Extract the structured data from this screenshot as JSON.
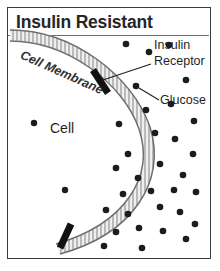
{
  "figure": {
    "title": "Insulin Resistant",
    "type": "biology-diagram",
    "frame_color": "#3a3a3a",
    "background": "#ffffff"
  },
  "labels": {
    "cell_membrane": "Cell Membrane",
    "insulin_line1": "Insulin",
    "insulin_line2": "Receptor",
    "glucose": "Glucose",
    "cell": "Cell"
  },
  "colors": {
    "membrane_fill": "#ededed",
    "membrane_stroke": "#8a8a8a",
    "receptor": "#111111",
    "glucose_dot": "#1c1c1c",
    "text": "#1f1f1f",
    "leader_line": "#1f1f1f"
  },
  "diagram_data": {
    "type": "diagram",
    "description": "Cell with a curved phospholipid bilayer membrane on the left, two insulin receptors embedded in the membrane, and many glucose molecules crowded outside the cell with only a few inside, illustrating insulin resistance.",
    "membrane": {
      "shape": "convex-arc",
      "band_thickness_px": 11,
      "tick_marks": true,
      "path": "M 4 28 C 60 28 118 72 134 120 C 150 170 120 220 52 240"
    },
    "receptors": [
      {
        "id": "receptor-top",
        "x": 92,
        "y": 73,
        "angle_deg": 60,
        "length_px": 25,
        "width_px": 7
      },
      {
        "id": "receptor-bottom",
        "x": 57,
        "y": 228,
        "angle_deg": 108,
        "length_px": 25,
        "width_px": 7
      }
    ],
    "glucose_inside_cell": [
      {
        "x": 26,
        "y": 115
      },
      {
        "x": 57,
        "y": 182
      }
    ],
    "glucose_outside_cell": [
      {
        "x": 118,
        "y": 36
      },
      {
        "x": 141,
        "y": 44
      },
      {
        "x": 161,
        "y": 37
      },
      {
        "x": 128,
        "y": 78
      },
      {
        "x": 178,
        "y": 72
      },
      {
        "x": 138,
        "y": 102
      },
      {
        "x": 163,
        "y": 96
      },
      {
        "x": 111,
        "y": 116
      },
      {
        "x": 186,
        "y": 113
      },
      {
        "x": 147,
        "y": 125
      },
      {
        "x": 167,
        "y": 131
      },
      {
        "x": 120,
        "y": 146
      },
      {
        "x": 185,
        "y": 146
      },
      {
        "x": 152,
        "y": 156
      },
      {
        "x": 130,
        "y": 170
      },
      {
        "x": 108,
        "y": 160
      },
      {
        "x": 175,
        "y": 167
      },
      {
        "x": 115,
        "y": 186
      },
      {
        "x": 143,
        "y": 183
      },
      {
        "x": 166,
        "y": 182
      },
      {
        "x": 188,
        "y": 184
      },
      {
        "x": 98,
        "y": 202
      },
      {
        "x": 120,
        "y": 206
      },
      {
        "x": 152,
        "y": 199
      },
      {
        "x": 172,
        "y": 204
      },
      {
        "x": 187,
        "y": 216
      },
      {
        "x": 131,
        "y": 220
      },
      {
        "x": 108,
        "y": 224
      },
      {
        "x": 155,
        "y": 223
      },
      {
        "x": 178,
        "y": 231
      },
      {
        "x": 96,
        "y": 238
      },
      {
        "x": 134,
        "y": 240
      }
    ],
    "leader_lines": [
      {
        "from_label": "Insulin Receptor",
        "x1": 143,
        "y1": 58,
        "x2": 92,
        "y2": 73
      },
      {
        "from_label": "Glucose",
        "x1": 150,
        "y1": 92,
        "x2": 130,
        "y2": 80
      }
    ]
  }
}
